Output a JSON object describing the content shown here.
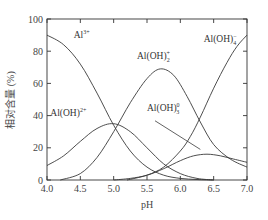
{
  "chart_data": {
    "type": "line",
    "title": "",
    "xlabel": "pH",
    "ylabel": "相对含量 (%)",
    "xlim": [
      4.0,
      7.0
    ],
    "ylim": [
      0,
      100
    ],
    "xticks": [
      "4.0",
      "4.5",
      "5.0",
      "5.5",
      "6.0",
      "6.5",
      "7.0"
    ],
    "yticks": [
      "0",
      "20",
      "40",
      "60",
      "80",
      "100"
    ],
    "grid": false,
    "legend": "inline labels",
    "series": [
      {
        "name": "Al3+",
        "label_main": "Al",
        "label_sup": "3+",
        "label_sub": "",
        "x": [
          4.0,
          4.25,
          4.5,
          4.75,
          5.0,
          5.25,
          5.5,
          5.75,
          6.0,
          6.25,
          6.5
        ],
        "values": [
          90,
          84,
          72,
          54,
          34,
          18,
          8,
          3,
          1,
          0.3,
          0
        ]
      },
      {
        "name": "Al(OH)2+",
        "label_main": "Al(OH)",
        "label_sup": "2+",
        "label_sub": "",
        "x": [
          4.0,
          4.25,
          4.5,
          4.75,
          5.0,
          5.25,
          5.5,
          5.75,
          6.0,
          6.25,
          6.5
        ],
        "values": [
          9,
          15,
          24,
          32,
          35,
          30,
          20,
          10,
          4,
          1,
          0
        ]
      },
      {
        "name": "Al(OH)2+ (dihydroxy)",
        "label_main": "Al(OH)",
        "label_sup": "+",
        "label_sub": "2",
        "x": [
          4.2,
          4.5,
          4.75,
          5.0,
          5.25,
          5.5,
          5.7,
          5.9,
          6.1,
          6.3,
          6.5,
          6.75,
          7.0
        ],
        "values": [
          0,
          4,
          14,
          30,
          48,
          63,
          69,
          65,
          52,
          36,
          22,
          13,
          8
        ]
      },
      {
        "name": "Al(OH)3 0",
        "label_main": "Al(OH)",
        "label_sup": "0",
        "label_sub": "3",
        "x": [
          5.0,
          5.25,
          5.5,
          5.75,
          6.0,
          6.2,
          6.4,
          6.6,
          6.8,
          7.0
        ],
        "values": [
          0,
          1,
          3,
          7,
          12,
          15,
          16,
          15,
          13,
          11
        ]
      },
      {
        "name": "Al(OH)4-",
        "label_main": "Al(OH)",
        "label_sup": "−",
        "label_sub": "4",
        "x": [
          5.2,
          5.5,
          5.75,
          6.0,
          6.15,
          6.3,
          6.5,
          6.7,
          6.85,
          7.0
        ],
        "values": [
          0,
          3,
          8,
          18,
          27,
          39,
          57,
          73,
          83,
          90
        ]
      }
    ],
    "annotations": [
      {
        "text": "Al3+",
        "at": [
          4.4,
          88
        ]
      },
      {
        "text": "Al(OH)2+",
        "at": [
          4.05,
          40
        ]
      },
      {
        "text": "Al(OH)2+",
        "at": [
          5.35,
          75
        ]
      },
      {
        "text": "Al(OH)3 0",
        "at": [
          5.5,
          43
        ],
        "leader_to": [
          6.3,
          19
        ]
      },
      {
        "text": "Al(OH)4-",
        "at": [
          6.35,
          86
        ]
      }
    ]
  }
}
